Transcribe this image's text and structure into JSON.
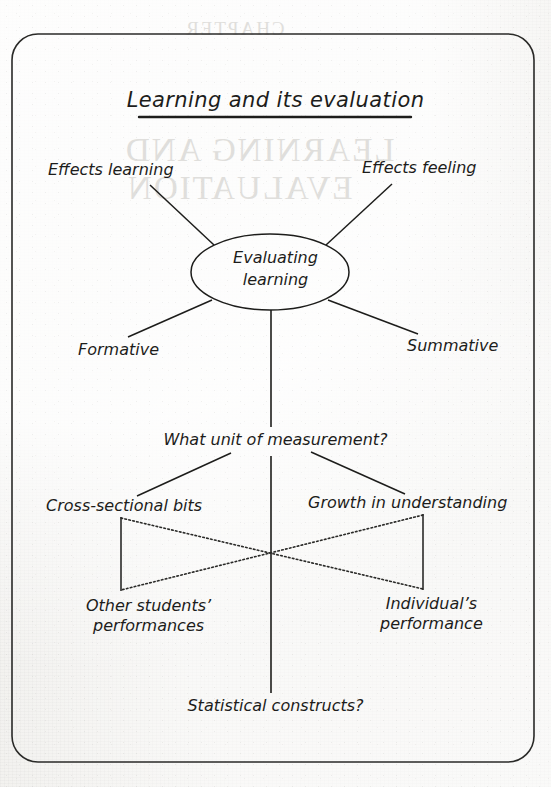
{
  "page": {
    "background_color": "#f2f1ee",
    "ink_color": "#1d1d1b",
    "frame": {
      "name": "rounded-rectangle-border"
    }
  },
  "ghost_text": {
    "note": "faint show-through text from the reverse side of the page",
    "chapter": "CHAPTER",
    "line1": "LEARNING AND",
    "line2": "EVALUATION"
  },
  "diagram": {
    "type": "concept-map",
    "title": "Learning and its evaluation",
    "center_node": {
      "shape": "ellipse",
      "label": "Evaluating\nlearning",
      "line1": "Evaluating",
      "line2": "learning"
    },
    "nodes": [
      {
        "id": "effects-learning",
        "label": "Effects learning"
      },
      {
        "id": "effects-feeling",
        "label": "Effects feeling"
      },
      {
        "id": "formative",
        "label": "Formative"
      },
      {
        "id": "summative",
        "label": "Summative"
      },
      {
        "id": "unit-of-measurement",
        "label": "What unit of measurement?"
      },
      {
        "id": "cross-sectional-bits",
        "label": "Cross-sectional bits"
      },
      {
        "id": "growth-in-understanding",
        "label": "Growth in understanding"
      },
      {
        "id": "other-students-performances",
        "line1": "Other students’",
        "line2": "performances"
      },
      {
        "id": "individuals-performance",
        "line1": "Individual’s",
        "line2": "performance"
      },
      {
        "id": "statistical-constructs",
        "label": "Statistical constructs?"
      }
    ],
    "connectors": [
      {
        "from": "center-node",
        "to": "effects-learning",
        "style": "solid"
      },
      {
        "from": "center-node",
        "to": "effects-feeling",
        "style": "solid"
      },
      {
        "from": "center-node",
        "to": "formative",
        "style": "solid"
      },
      {
        "from": "center-node",
        "to": "summative",
        "style": "solid"
      },
      {
        "from": "center-node",
        "to": "unit-of-measurement",
        "style": "solid-vertical"
      },
      {
        "from": "unit-of-measurement",
        "to": "cross-sectional-bits",
        "style": "solid"
      },
      {
        "from": "unit-of-measurement",
        "to": "growth-in-understanding",
        "style": "solid"
      },
      {
        "from": "unit-of-measurement",
        "to": "statistical-constructs",
        "style": "solid-vertical"
      },
      {
        "from": "cross-sectional-bits",
        "to": "other-students-performances",
        "style": "solid-vertical"
      },
      {
        "from": "growth-in-understanding",
        "to": "individuals-performance",
        "style": "solid-vertical"
      },
      {
        "from": "cross-sectional-bits",
        "to": "individuals-performance",
        "style": "dotted-diagonal"
      },
      {
        "from": "growth-in-understanding",
        "to": "other-students-performances",
        "style": "dotted-diagonal"
      }
    ]
  }
}
